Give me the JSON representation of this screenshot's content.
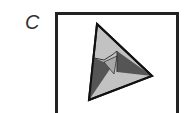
{
  "figure": {
    "label": "C",
    "colors": {
      "light": "#c2c2c2",
      "mid": "#a8a8a8",
      "dark": "#555555",
      "stroke": "#111111"
    }
  }
}
